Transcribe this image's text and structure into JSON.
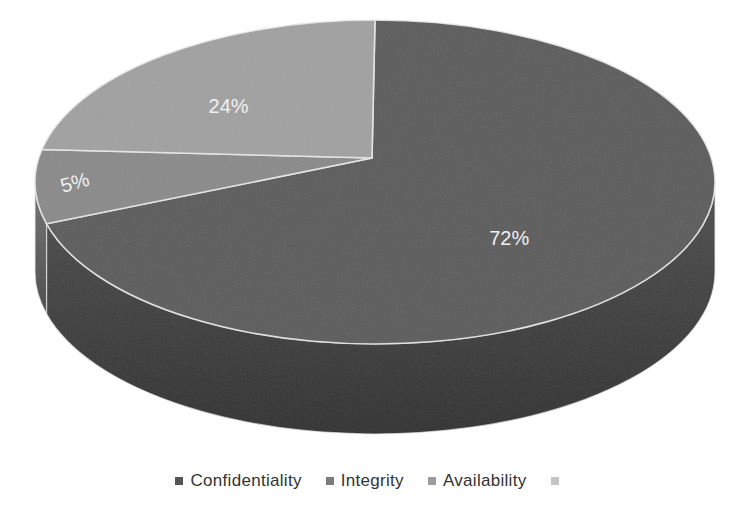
{
  "figure": {
    "background": "#ffffff"
  },
  "chart_data": {
    "type": "pie",
    "effect": "3d",
    "title": "",
    "unit": "%",
    "values_note": "labels as printed; printed percentages sum to 101 due to rounding",
    "slices": [
      {
        "label": "Confidentiality",
        "value": 72,
        "data_label": "72%",
        "color": "#5c5c5c",
        "side_color": "#4a4a4a"
      },
      {
        "label": "Integrity",
        "value": 5,
        "data_label": "5%",
        "color": "#8a8a8a",
        "side_color": "#6e6e6e"
      },
      {
        "label": "Availability",
        "value": 24,
        "data_label": "24%",
        "color": "#a1a1a1",
        "side_color": "#8a8a8a"
      }
    ],
    "data_label_color": "#f4f4f4",
    "slice_outline_color": "#ebebeb",
    "legend": {
      "position": "bottom",
      "text_color": "#333333",
      "items": [
        {
          "label": "Confidentiality",
          "swatch_color": "#555555"
        },
        {
          "label": "Integrity",
          "swatch_color": "#7d7d7d"
        },
        {
          "label": "Availability",
          "swatch_color": "#9c9c9c"
        },
        {
          "label": "",
          "swatch_color": "#c3c3c3"
        }
      ]
    }
  }
}
